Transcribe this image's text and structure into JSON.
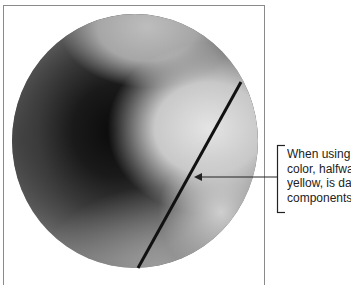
{
  "figure": {
    "callout": {
      "lines": [
        "When using i",
        "color, halfwa",
        "yellow, is dar",
        "components"
      ]
    },
    "colors": {
      "frame": "#8a8a8a",
      "line": "#111111",
      "text": "#222222"
    }
  }
}
